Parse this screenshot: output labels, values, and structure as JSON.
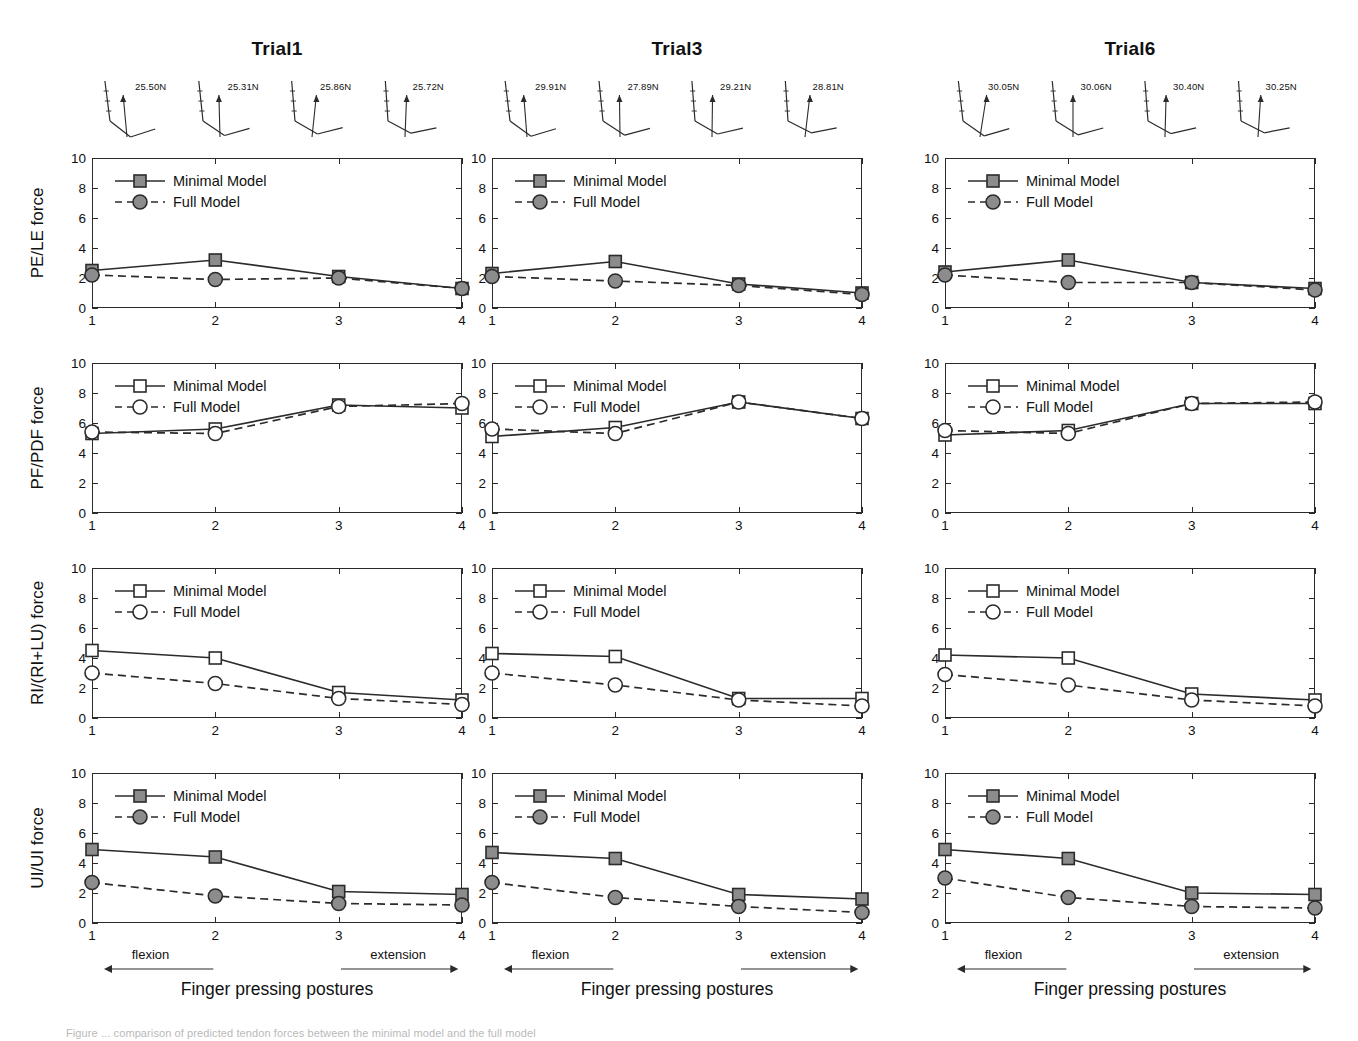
{
  "figure": {
    "caption": "Figure ... comparison of predicted tendon forces between the minimal model and the full model",
    "axis_title": "Finger pressing postures",
    "flexion_label": "flexion",
    "extension_label": "extension",
    "legend": {
      "minimal": "Minimal Model",
      "full": "Full Model"
    },
    "marker_colors": {
      "filled": "#8c8c8c",
      "open": "#ffffff",
      "line": "#2b2b2b"
    }
  },
  "columns": [
    {
      "title": "Trial1",
      "postures": [
        {
          "force": "25.50N",
          "tip_angle": -14,
          "mid_angle": 38,
          "dist_angle": -18,
          "arrow_tilt": -7
        },
        {
          "force": "25.31N",
          "tip_angle": -10,
          "mid_angle": 34,
          "dist_angle": -16,
          "arrow_tilt": -2
        },
        {
          "force": "25.86N",
          "tip_angle": -6,
          "mid_angle": 30,
          "dist_angle": -14,
          "arrow_tilt": 8
        },
        {
          "force": "25.72N",
          "tip_angle": -3,
          "mid_angle": 28,
          "dist_angle": -12,
          "arrow_tilt": 3
        }
      ]
    },
    {
      "title": "Trial3",
      "postures": [
        {
          "force": "29.91N",
          "tip_angle": -13,
          "mid_angle": 36,
          "dist_angle": -17,
          "arrow_tilt": -6
        },
        {
          "force": "27.89N",
          "tip_angle": -9,
          "mid_angle": 33,
          "dist_angle": -15,
          "arrow_tilt": -1
        },
        {
          "force": "29.21N",
          "tip_angle": -5,
          "mid_angle": 30,
          "dist_angle": -13,
          "arrow_tilt": 1
        },
        {
          "force": "28.81N",
          "tip_angle": -3,
          "mid_angle": 27,
          "dist_angle": -11,
          "arrow_tilt": 9
        }
      ]
    },
    {
      "title": "Trial6",
      "postures": [
        {
          "force": "30.05N",
          "tip_angle": -12,
          "mid_angle": 35,
          "dist_angle": -16,
          "arrow_tilt": 12
        },
        {
          "force": "30.06N",
          "tip_angle": -8,
          "mid_angle": 32,
          "dist_angle": -15,
          "arrow_tilt": 0
        },
        {
          "force": "30.40N",
          "tip_angle": -5,
          "mid_angle": 29,
          "dist_angle": -13,
          "arrow_tilt": 2
        },
        {
          "force": "30.25N",
          "tip_angle": -2,
          "mid_angle": 27,
          "dist_angle": -11,
          "arrow_tilt": 5
        }
      ]
    }
  ],
  "rows": [
    {
      "ylabel": "PE/LE force",
      "marker_fill": "filled"
    },
    {
      "ylabel": "PF/PDF force",
      "marker_fill": "open"
    },
    {
      "ylabel": "RI/(RI+LU) force",
      "marker_fill": "open"
    },
    {
      "ylabel": "UI/UI force",
      "marker_fill": "filled"
    }
  ],
  "chart_data": {
    "type": "line",
    "xlabel": "Finger pressing postures",
    "x": [
      1,
      2,
      3,
      4
    ],
    "xticks": [
      "1",
      "2",
      "3",
      "4"
    ],
    "yticks": [
      "0",
      "2",
      "4",
      "6",
      "8",
      "10"
    ],
    "ylim": [
      0,
      10
    ],
    "xlim": [
      1,
      4
    ],
    "grid": false,
    "legend_position": "top-left",
    "panels": [
      {
        "row": 0,
        "column": 0,
        "trial": "Trial1",
        "ylabel": "PE/LE force",
        "series": [
          {
            "name": "Minimal Model",
            "values": [
              2.5,
              3.2,
              2.1,
              1.3
            ],
            "style": "solid",
            "marker": "square"
          },
          {
            "name": "Full Model",
            "values": [
              2.2,
              1.9,
              2.0,
              1.3
            ],
            "style": "dashed",
            "marker": "circle"
          }
        ]
      },
      {
        "row": 0,
        "column": 1,
        "trial": "Trial3",
        "ylabel": "PE/LE force",
        "series": [
          {
            "name": "Minimal Model",
            "values": [
              2.3,
              3.1,
              1.6,
              1.0
            ],
            "style": "solid",
            "marker": "square"
          },
          {
            "name": "Full Model",
            "values": [
              2.1,
              1.8,
              1.5,
              0.9
            ],
            "style": "dashed",
            "marker": "circle"
          }
        ]
      },
      {
        "row": 0,
        "column": 2,
        "trial": "Trial6",
        "ylabel": "PE/LE force",
        "series": [
          {
            "name": "Minimal Model",
            "values": [
              2.4,
              3.2,
              1.7,
              1.3
            ],
            "style": "solid",
            "marker": "square"
          },
          {
            "name": "Full Model",
            "values": [
              2.2,
              1.7,
              1.7,
              1.2
            ],
            "style": "dashed",
            "marker": "circle"
          }
        ]
      },
      {
        "row": 1,
        "column": 0,
        "trial": "Trial1",
        "ylabel": "PF/PDF force",
        "series": [
          {
            "name": "Minimal Model",
            "values": [
              5.3,
              5.6,
              7.2,
              7.0
            ],
            "style": "solid",
            "marker": "square"
          },
          {
            "name": "Full Model",
            "values": [
              5.4,
              5.3,
              7.1,
              7.3
            ],
            "style": "dashed",
            "marker": "circle"
          }
        ]
      },
      {
        "row": 1,
        "column": 1,
        "trial": "Trial3",
        "ylabel": "PF/PDF force",
        "series": [
          {
            "name": "Minimal Model",
            "values": [
              5.1,
              5.7,
              7.4,
              6.3
            ],
            "style": "solid",
            "marker": "square"
          },
          {
            "name": "Full Model",
            "values": [
              5.6,
              5.3,
              7.4,
              6.3
            ],
            "style": "dashed",
            "marker": "circle"
          }
        ]
      },
      {
        "row": 1,
        "column": 2,
        "trial": "Trial6",
        "ylabel": "PF/PDF force",
        "series": [
          {
            "name": "Minimal Model",
            "values": [
              5.2,
              5.5,
              7.3,
              7.3
            ],
            "style": "solid",
            "marker": "square"
          },
          {
            "name": "Full Model",
            "values": [
              5.5,
              5.3,
              7.3,
              7.4
            ],
            "style": "dashed",
            "marker": "circle"
          }
        ]
      },
      {
        "row": 2,
        "column": 0,
        "trial": "Trial1",
        "ylabel": "RI/(RI+LU) force",
        "series": [
          {
            "name": "Minimal Model",
            "values": [
              4.5,
              4.0,
              1.7,
              1.2
            ],
            "style": "solid",
            "marker": "square"
          },
          {
            "name": "Full Model",
            "values": [
              3.0,
              2.3,
              1.3,
              0.9
            ],
            "style": "dashed",
            "marker": "circle"
          }
        ]
      },
      {
        "row": 2,
        "column": 1,
        "trial": "Trial3",
        "ylabel": "RI/(RI+LU) force",
        "series": [
          {
            "name": "Minimal Model",
            "values": [
              4.3,
              4.1,
              1.3,
              1.3
            ],
            "style": "solid",
            "marker": "square"
          },
          {
            "name": "Full Model",
            "values": [
              3.0,
              2.2,
              1.2,
              0.8
            ],
            "style": "dashed",
            "marker": "circle"
          }
        ]
      },
      {
        "row": 2,
        "column": 2,
        "trial": "Trial6",
        "ylabel": "RI/(RI+LU) force",
        "series": [
          {
            "name": "Minimal Model",
            "values": [
              4.2,
              4.0,
              1.6,
              1.2
            ],
            "style": "solid",
            "marker": "square"
          },
          {
            "name": "Full Model",
            "values": [
              2.9,
              2.2,
              1.2,
              0.8
            ],
            "style": "dashed",
            "marker": "circle"
          }
        ]
      },
      {
        "row": 3,
        "column": 0,
        "trial": "Trial1",
        "ylabel": "UI/UI force",
        "series": [
          {
            "name": "Minimal Model",
            "values": [
              4.9,
              4.4,
              2.1,
              1.9
            ],
            "style": "solid",
            "marker": "square"
          },
          {
            "name": "Full Model",
            "values": [
              2.7,
              1.8,
              1.3,
              1.2
            ],
            "style": "dashed",
            "marker": "circle"
          }
        ]
      },
      {
        "row": 3,
        "column": 1,
        "trial": "Trial3",
        "ylabel": "UI/UI force",
        "series": [
          {
            "name": "Minimal Model",
            "values": [
              4.7,
              4.3,
              1.9,
              1.6
            ],
            "style": "solid",
            "marker": "square"
          },
          {
            "name": "Full Model",
            "values": [
              2.7,
              1.7,
              1.1,
              0.7
            ],
            "style": "dashed",
            "marker": "circle"
          }
        ]
      },
      {
        "row": 3,
        "column": 2,
        "trial": "Trial6",
        "ylabel": "UI/UI force",
        "series": [
          {
            "name": "Minimal Model",
            "values": [
              4.9,
              4.3,
              2.0,
              1.9
            ],
            "style": "solid",
            "marker": "square"
          },
          {
            "name": "Full Model",
            "values": [
              3.0,
              1.7,
              1.1,
              1.0
            ],
            "style": "dashed",
            "marker": "circle"
          }
        ]
      }
    ]
  }
}
